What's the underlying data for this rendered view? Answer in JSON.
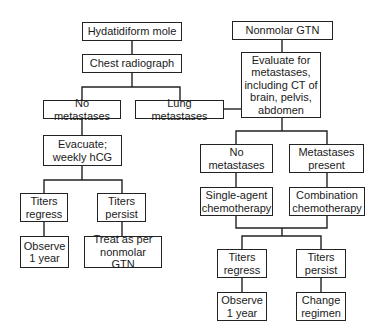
{
  "diagram": {
    "type": "flowchart",
    "left_branch": {
      "start": "Hydatidiform mole",
      "step1": "Chest radiograph",
      "no_mets": "No metastases",
      "lung_mets": "Lung metastases",
      "evacuate": "Evacuate;\nweekly hCG",
      "titers_regress": "Titers\nregress",
      "titers_persist": "Titers\npersist",
      "observe": "Observe\n1 year",
      "treat": "Treat as per\nnonmolar GTN"
    },
    "right_branch": {
      "start": "Nonmolar GTN",
      "evaluate": "Evaluate for\nmetastases,\nincluding CT of\nbrain, pelvis,\nabdomen",
      "no_mets": "No\nmetastases",
      "mets_present": "Metastases\npresent",
      "single_agent": "Single-agent\nchemotherapy",
      "combination": "Combination\nchemotherapy",
      "titers_regress": "Titers\nregress",
      "titers_persist": "Titers\npersist",
      "observe": "Observe\n1 year",
      "change": "Change\nregimen"
    }
  }
}
